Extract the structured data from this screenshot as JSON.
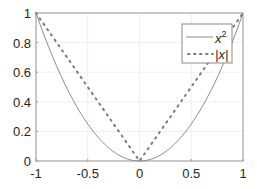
{
  "chart_data": {
    "type": "line",
    "title": "",
    "xlabel": "",
    "ylabel": "",
    "xlim": [
      -1,
      1
    ],
    "ylim": [
      0,
      1
    ],
    "grid": true,
    "legend_position": "northeast",
    "x_ticks": [
      "-1",
      "-0.5",
      "0",
      "0.5",
      "1"
    ],
    "y_ticks": [
      "0",
      "0.2",
      "0.4",
      "0.6",
      "0.8",
      "1"
    ],
    "series": [
      {
        "name": "x^2",
        "label": "x",
        "superscript": "2",
        "style": "solid",
        "color": "#8c8c8c",
        "x": [
          -1,
          -0.5,
          0,
          0.5,
          1
        ],
        "y": [
          1,
          0.25,
          0,
          0.25,
          1
        ]
      },
      {
        "name": "|x|",
        "label": "|x|",
        "style": "dotted",
        "color": "#7a7a7a",
        "x": [
          -1,
          -0.5,
          0,
          0.5,
          1
        ],
        "y": [
          1,
          0.5,
          0,
          0.5,
          1
        ]
      }
    ]
  }
}
